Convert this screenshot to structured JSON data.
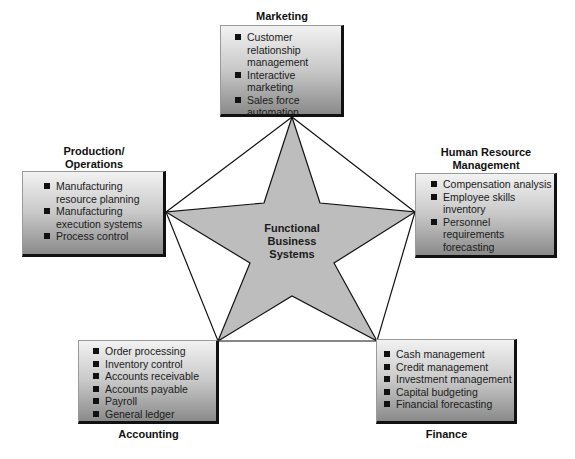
{
  "diagram": {
    "center": {
      "lines": [
        "Functional",
        "Business",
        "Systems"
      ]
    },
    "nodes": {
      "marketing": {
        "title": "Marketing",
        "items": [
          "Customer relationship management",
          "Interactive marketing",
          "Sales force automation"
        ]
      },
      "production": {
        "title_lines": [
          "Production/",
          "Operations"
        ],
        "items": [
          "Manufacturing resource planning",
          "Manufacturing execution systems",
          "Process control"
        ]
      },
      "hr": {
        "title_lines": [
          "Human Resource",
          "Management"
        ],
        "items": [
          "Compensation analysis",
          "Employee skills inventory",
          "Personnel requirements forecasting"
        ]
      },
      "accounting": {
        "title": "Accounting",
        "items": [
          "Order processing",
          "Inventory control",
          "Accounts receivable",
          "Accounts payable",
          "Payroll",
          "General ledger"
        ]
      },
      "finance": {
        "title": "Finance",
        "items": [
          "Cash management",
          "Credit management",
          "Investment management",
          "Capital budgeting",
          "Financial forecasting"
        ]
      }
    },
    "colors": {
      "star_fill": "#bdbdbd",
      "outline": "#111111",
      "box_gradient_top": "#f2f2f2",
      "box_gradient_bottom": "#8a8a8a"
    }
  }
}
